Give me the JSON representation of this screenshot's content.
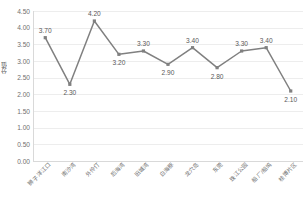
{
  "chart_data": {
    "type": "line",
    "title": "",
    "xlabel": "",
    "ylabel": "分值",
    "ylim": [
      0.0,
      4.5
    ],
    "y_ticks": [
      "0.00",
      "0.50",
      "1.00",
      "1.50",
      "2.00",
      "2.50",
      "3.00",
      "3.50",
      "4.00",
      "4.50"
    ],
    "grid": true,
    "legend": "none",
    "series_color": "#808080",
    "marker": "square",
    "categories": [
      "狮子洋江口",
      "南沙湾",
      "外伶仃",
      "后海湾",
      "旧城湾",
      "白海豚",
      "龙穴岛",
      "东莞",
      "珠江公园",
      "船厂/船坞",
      "桂博片区"
    ],
    "values": [
      3.7,
      2.3,
      4.2,
      3.2,
      3.3,
      2.9,
      3.4,
      2.8,
      3.3,
      3.4,
      2.1
    ],
    "data_labels": [
      "3.70",
      "2.30",
      "4.20",
      "3.20",
      "3.30",
      "2.90",
      "3.40",
      "2.80",
      "3.30",
      "3.40",
      "2.10"
    ],
    "label_positions": [
      "above",
      "below",
      "above",
      "below",
      "above",
      "below",
      "above",
      "below",
      "above",
      "above",
      "below"
    ]
  },
  "colors": {
    "line": "#808080",
    "marker": "#808080",
    "gridline": "#ededed",
    "axis": "#d9d9d9",
    "text": "#595959",
    "background": "#ffffff"
  }
}
